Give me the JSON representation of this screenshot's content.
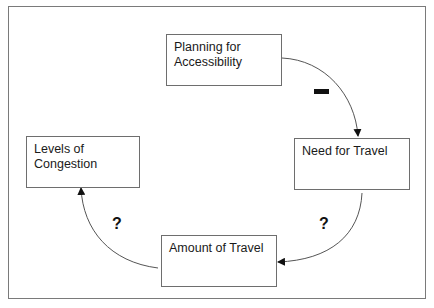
{
  "diagram": {
    "type": "causal-loop",
    "colors": {
      "frame_border": "#7a7a7a",
      "node_border": "#6e6e6e",
      "link": "#555555",
      "text": "#1a1a1a",
      "polarity": "#111111"
    },
    "nodes": [
      {
        "id": "planning",
        "lines": [
          "Planning for",
          "Accessibility"
        ]
      },
      {
        "id": "need",
        "lines": [
          "Need for Travel"
        ]
      },
      {
        "id": "amount",
        "lines": [
          "Amount of Travel"
        ]
      },
      {
        "id": "congestion",
        "lines": [
          "Levels of",
          "Congestion"
        ]
      }
    ],
    "links": [
      {
        "from": "planning",
        "to": "need",
        "polarity": "−"
      },
      {
        "from": "need",
        "to": "amount",
        "polarity": "?"
      },
      {
        "from": "amount",
        "to": "congestion",
        "polarity": "?"
      }
    ],
    "labels": {
      "link_planning_need": "−",
      "link_need_amount": "?",
      "link_amount_congestion": "?"
    }
  }
}
